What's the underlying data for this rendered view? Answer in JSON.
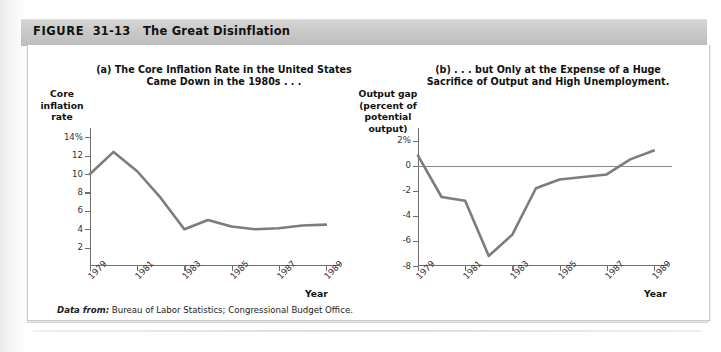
{
  "figure": {
    "number_label": "FIGURE",
    "number": "31-13",
    "title": "The Great Disinflation",
    "source_label": "Data from:",
    "source_text": "Bureau of Labor Statistics; Congressional Budget Office."
  },
  "colors": {
    "header_bar": "#c9c9c9",
    "series_line": "#7c7c7c",
    "axis": "#6f6f6f",
    "panel_background": "#ffffff"
  },
  "chart_data": [
    {
      "type": "line",
      "panel": "a",
      "title": "(a) The Core Inflation Rate in the United States Came Down in the 1980s . . .",
      "title_line1": "(a) The Core Inflation Rate in the United States",
      "title_line2": "Came Down in the 1980s . . .",
      "ylabel": "Core inflation rate",
      "ylabel_lines": [
        "Core",
        "inflation",
        "rate"
      ],
      "xlabel": "Year",
      "ylim": [
        0,
        15
      ],
      "xlim": [
        1979,
        1989.6
      ],
      "grid": false,
      "legend": "none",
      "yticks": [
        14,
        12,
        10,
        8,
        6,
        4,
        2
      ],
      "ytick_labels": [
        "14%",
        "12",
        "10",
        "8",
        "6",
        "4",
        "2"
      ],
      "xticks": [
        1979,
        1981,
        1983,
        1985,
        1987,
        1989
      ],
      "xtick_labels": [
        "1979",
        "1981",
        "1983",
        "1985",
        "1987",
        "1989"
      ],
      "x": [
        1979,
        1980,
        1981,
        1982,
        1983,
        1984,
        1985,
        1986,
        1987,
        1988,
        1989
      ],
      "values": [
        10.0,
        12.4,
        10.3,
        7.4,
        4.0,
        5.0,
        4.3,
        4.0,
        4.1,
        4.4,
        4.5
      ]
    },
    {
      "type": "line",
      "panel": "b",
      "title": "(b) . . . but Only at the Expense of a Huge Sacrifice of Output and High Unemployment.",
      "title_line1": "(b) . . . but Only at the Expense of a Huge",
      "title_line2": "Sacrifice of Output and High Unemployment.",
      "ylabel": "Output gap (percent of potential output)",
      "ylabel_lines": [
        "Output gap",
        "(percent of",
        "potential",
        "output)"
      ],
      "xlabel": "Year",
      "ylim": [
        -8,
        3
      ],
      "xlim": [
        1979,
        1989.6
      ],
      "grid": false,
      "legend": "none",
      "zero_line": true,
      "yticks": [
        2,
        0,
        -2,
        -4,
        -6,
        -8
      ],
      "ytick_labels": [
        "2%",
        "0",
        "-2",
        "-4",
        "-6",
        "-8"
      ],
      "xticks": [
        1979,
        1981,
        1983,
        1985,
        1987,
        1989
      ],
      "xtick_labels": [
        "1979",
        "1981",
        "1983",
        "1985",
        "1987",
        "1989"
      ],
      "x": [
        1979,
        1980,
        1981,
        1982,
        1983,
        1984,
        1985,
        1986,
        1987,
        1988,
        1989
      ],
      "values": [
        0.8,
        -2.5,
        -2.8,
        -7.2,
        -5.5,
        -1.8,
        -1.1,
        -0.9,
        -0.7,
        0.5,
        1.2
      ]
    }
  ]
}
